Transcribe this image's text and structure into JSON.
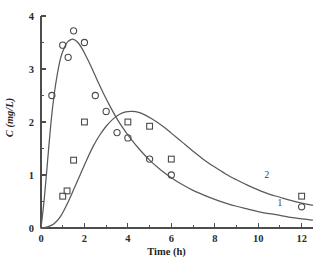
{
  "chart_data": {
    "type": "scatter",
    "title": "",
    "xlabel": "Time (h)",
    "ylabel": "C (mg/L)",
    "xlim": [
      0,
      12.5
    ],
    "ylim": [
      0,
      4
    ],
    "xticks": [
      0,
      2,
      4,
      6,
      8,
      10,
      12
    ],
    "xticklabels": [
      "0",
      "2",
      "4",
      "6",
      "8",
      "10",
      "12"
    ],
    "xminorticks": [
      1,
      3,
      5,
      7,
      9,
      11
    ],
    "yticks": [
      0,
      1,
      2,
      3,
      4
    ],
    "yticklabels": [
      "0",
      "1",
      "2",
      "3",
      "4"
    ],
    "yminorticks": [
      0.5,
      1.5,
      2.5,
      3.5
    ],
    "grid": false,
    "legend_position": "inline-curve-labels",
    "series": [
      {
        "name": "1",
        "label": "1",
        "marker": "circle",
        "curve_label": "1",
        "curve_label_x": 11.0,
        "curve_label_y": 0.42,
        "x": [
          0.5,
          1.0,
          1.25,
          1.5,
          2.0,
          2.5,
          3.0,
          3.5,
          4.0,
          5.0,
          6.0,
          12.0
        ],
        "y": [
          2.5,
          3.45,
          3.22,
          3.72,
          3.5,
          2.5,
          2.2,
          1.8,
          1.7,
          1.3,
          1.0,
          0.4
        ],
        "fit_curve": [
          [
            0.0,
            0.0
          ],
          [
            0.15,
            0.55
          ],
          [
            0.3,
            1.25
          ],
          [
            0.45,
            1.95
          ],
          [
            0.6,
            2.5
          ],
          [
            0.75,
            2.9
          ],
          [
            0.9,
            3.2
          ],
          [
            1.05,
            3.38
          ],
          [
            1.2,
            3.5
          ],
          [
            1.35,
            3.55
          ],
          [
            1.5,
            3.56
          ],
          [
            1.7,
            3.5
          ],
          [
            1.9,
            3.38
          ],
          [
            2.1,
            3.22
          ],
          [
            2.3,
            3.05
          ],
          [
            2.6,
            2.78
          ],
          [
            2.9,
            2.52
          ],
          [
            3.2,
            2.28
          ],
          [
            3.5,
            2.06
          ],
          [
            3.8,
            1.87
          ],
          [
            4.1,
            1.7
          ],
          [
            4.5,
            1.5
          ],
          [
            5.0,
            1.28
          ],
          [
            5.5,
            1.1
          ],
          [
            6.0,
            0.95
          ],
          [
            6.5,
            0.82
          ],
          [
            7.0,
            0.71
          ],
          [
            7.5,
            0.62
          ],
          [
            8.0,
            0.54
          ],
          [
            8.5,
            0.47
          ],
          [
            9.0,
            0.41
          ],
          [
            9.5,
            0.36
          ],
          [
            10.0,
            0.31
          ],
          [
            10.5,
            0.27
          ],
          [
            11.0,
            0.24
          ],
          [
            11.5,
            0.2
          ],
          [
            12.0,
            0.17
          ],
          [
            12.5,
            0.15
          ]
        ]
      },
      {
        "name": "2",
        "label": "2",
        "marker": "square",
        "curve_label": "2",
        "curve_label_x": 10.4,
        "curve_label_y": 0.95,
        "x": [
          1.0,
          1.2,
          1.5,
          2.0,
          4.0,
          5.0,
          6.0,
          12.0
        ],
        "y": [
          0.6,
          0.7,
          1.28,
          2.0,
          2.0,
          1.92,
          1.3,
          0.6
        ],
        "fit_curve": [
          [
            0.0,
            0.0
          ],
          [
            0.3,
            0.02
          ],
          [
            0.6,
            0.08
          ],
          [
            0.9,
            0.22
          ],
          [
            1.2,
            0.45
          ],
          [
            1.5,
            0.72
          ],
          [
            1.8,
            1.0
          ],
          [
            2.1,
            1.28
          ],
          [
            2.4,
            1.54
          ],
          [
            2.7,
            1.75
          ],
          [
            3.0,
            1.92
          ],
          [
            3.3,
            2.05
          ],
          [
            3.6,
            2.14
          ],
          [
            3.9,
            2.19
          ],
          [
            4.2,
            2.2
          ],
          [
            4.5,
            2.18
          ],
          [
            4.8,
            2.13
          ],
          [
            5.1,
            2.06
          ],
          [
            5.4,
            1.98
          ],
          [
            5.7,
            1.89
          ],
          [
            6.0,
            1.79
          ],
          [
            6.5,
            1.62
          ],
          [
            7.0,
            1.45
          ],
          [
            7.5,
            1.29
          ],
          [
            8.0,
            1.15
          ],
          [
            8.5,
            1.02
          ],
          [
            9.0,
            0.91
          ],
          [
            9.5,
            0.81
          ],
          [
            10.0,
            0.72
          ],
          [
            10.5,
            0.64
          ],
          [
            11.0,
            0.58
          ],
          [
            11.5,
            0.52
          ],
          [
            12.0,
            0.47
          ],
          [
            12.5,
            0.43
          ]
        ]
      }
    ],
    "colors": {
      "curve": "#5a5a5a",
      "marker": "#4a4a4a",
      "axis": "#4d4d4d",
      "text": "#1f1f1f"
    }
  }
}
